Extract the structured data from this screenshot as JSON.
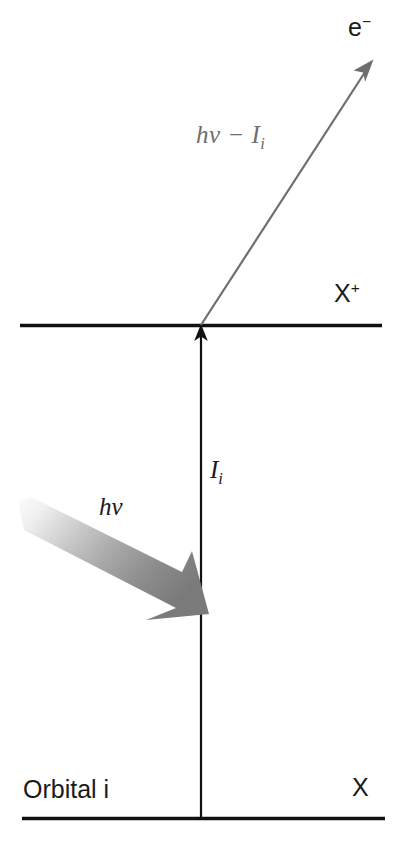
{
  "figure": {
    "background_color": "#ffffff",
    "line_color": "#111111",
    "gray_arrow_color": "#6e6e6e",
    "photon_arrow_dark": "#7d7d7d",
    "photon_arrow_light": "#f2f2f2"
  },
  "labels": {
    "electron": "e",
    "electron_superscript": "−",
    "photoelectron_energy_h": "h",
    "photoelectron_energy_nu": "ν",
    "photoelectron_energy_minus": " − ",
    "photoelectron_energy_I": "I",
    "photoelectron_energy_sub": "i",
    "ion_state": "X",
    "ion_state_superscript": "+",
    "ionization_energy": "I",
    "ionization_energy_sub": "i",
    "photon_energy_h": "h",
    "photon_energy_nu": "ν",
    "neutral_state": "X",
    "orbital": "Orbital  i"
  },
  "levels": [
    {
      "name": "ion-level-line",
      "state_label": "X⁺",
      "y": 325,
      "x_start": 20,
      "x_end": 382
    },
    {
      "name": "ground-level-line",
      "state_label": "X",
      "y": 818,
      "x_start": 22,
      "x_end": 385
    }
  ],
  "arrows": [
    {
      "name": "ionization-arrow",
      "meaning": "Iᵢ ionization energy, vertical transition from X to X⁺",
      "from": [
        201,
        818
      ],
      "to": [
        201,
        326
      ],
      "color": "#111111",
      "style": "thin-line-with-head"
    },
    {
      "name": "photoelectron-arrow",
      "meaning": "hν − Iᵢ kinetic energy of ejected electron",
      "from": [
        201,
        325
      ],
      "to": [
        372,
        62
      ],
      "color": "#6e6e6e",
      "style": "thin-line-with-head"
    },
    {
      "name": "photon-arrow",
      "meaning": "hν incident photon",
      "from": [
        20,
        500
      ],
      "to": [
        208,
        612
      ],
      "color_gradient": [
        "#f4f4f4",
        "#7d7d7d"
      ],
      "style": "thick-tapered-block-arrow"
    }
  ]
}
